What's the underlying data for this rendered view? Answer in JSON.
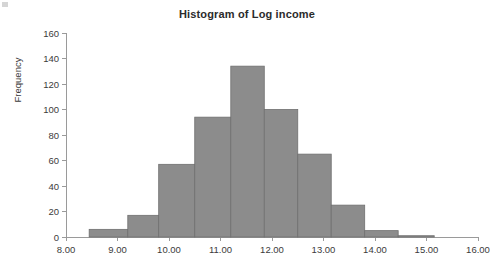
{
  "chart_data": {
    "type": "bar",
    "title": "Histogram of Log income",
    "xlabel": "",
    "ylabel": "Frequency",
    "xlim": [
      8.0,
      16.0
    ],
    "ylim": [
      0,
      160
    ],
    "grid": false,
    "legend": "none",
    "bin_width": 0.5,
    "bin_starts": [
      8.5,
      9.0,
      9.5,
      10.0,
      10.5,
      11.0,
      11.5,
      12.0,
      12.5,
      13.0,
      13.5,
      14.0,
      14.5
    ],
    "categories": [
      "8.5-9.0",
      "9.0-9.5",
      "9.5-10.0",
      "10.0-10.5",
      "10.5-11.0",
      "11.0-11.5",
      "11.5-12.0",
      "12.0-12.5",
      "12.5-13.0",
      "13.0-13.5",
      "13.5-14.0",
      "14.0-14.5",
      "14.5-15.2"
    ],
    "values": [
      6,
      6,
      17,
      57,
      57,
      94,
      134,
      100,
      65,
      65,
      25,
      5,
      1
    ],
    "bars": [
      {
        "x0": 8.45,
        "x1": 9.2,
        "value": 6
      },
      {
        "x0": 9.2,
        "x1": 9.8,
        "value": 17
      },
      {
        "x0": 9.8,
        "x1": 10.5,
        "value": 57
      },
      {
        "x0": 10.5,
        "x1": 11.2,
        "value": 94
      },
      {
        "x0": 11.2,
        "x1": 11.85,
        "value": 134
      },
      {
        "x0": 11.85,
        "x1": 12.5,
        "value": 100
      },
      {
        "x0": 12.5,
        "x1": 13.15,
        "value": 65
      },
      {
        "x0": 13.15,
        "x1": 13.8,
        "value": 25
      },
      {
        "x0": 13.8,
        "x1": 14.45,
        "value": 5
      },
      {
        "x0": 14.45,
        "x1": 15.15,
        "value": 1
      }
    ],
    "x_ticks": [
      {
        "value": 8.0,
        "label": "8.00"
      },
      {
        "value": 9.0,
        "label": "9.00"
      },
      {
        "value": 10.0,
        "label": "10.00"
      },
      {
        "value": 11.0,
        "label": "11.00"
      },
      {
        "value": 12.0,
        "label": "12.00"
      },
      {
        "value": 13.0,
        "label": "13.00"
      },
      {
        "value": 14.0,
        "label": "14.00"
      },
      {
        "value": 15.0,
        "label": "15.00"
      },
      {
        "value": 16.0,
        "label": "16.00"
      }
    ],
    "y_ticks": [
      {
        "value": 0,
        "label": "0"
      },
      {
        "value": 20,
        "label": "20"
      },
      {
        "value": 40,
        "label": "40"
      },
      {
        "value": 60,
        "label": "60"
      },
      {
        "value": 80,
        "label": "80"
      },
      {
        "value": 100,
        "label": "100"
      },
      {
        "value": 120,
        "label": "120"
      },
      {
        "value": 140,
        "label": "140"
      },
      {
        "value": 160,
        "label": "160"
      }
    ],
    "colors": {
      "bar_fill": "#8c8c8c",
      "bar_stroke": "#6f6f6f",
      "axis": "#9a9a9a",
      "text": "#3b3b3b",
      "title": "#2b2b2b",
      "background": "#ffffff"
    }
  }
}
